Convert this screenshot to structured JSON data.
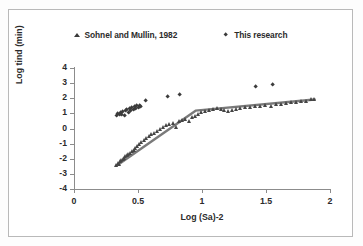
{
  "figure": {
    "background_color": "#ffffff",
    "border_color": "#b9b9b9"
  },
  "legend": {
    "position": "top-center",
    "entries": [
      {
        "label": "Sohnel and Mullin, 1982",
        "marker": "triangle-marker-icon",
        "color": "#3a3a3a"
      },
      {
        "label": "This research",
        "marker": "diamond-marker-icon",
        "color": "#3a3a3a"
      }
    ]
  },
  "chart_data": {
    "type": "scatter",
    "title": "",
    "xlabel": "Log (Sa)-2",
    "ylabel": "Log tind (min)",
    "xlim": [
      0,
      2
    ],
    "ylim": [
      -4,
      4
    ],
    "xticks": [
      0,
      0.5,
      1,
      1.5,
      2
    ],
    "xtick_labels": [
      "0",
      "0.5",
      "1",
      "1.5",
      "2"
    ],
    "yticks": [
      -4,
      -3,
      -2,
      -1,
      0,
      1,
      2,
      3,
      4
    ],
    "ytick_labels": [
      "-4",
      "-3",
      "-2",
      "-1",
      "0",
      "1",
      "2",
      "3",
      "4"
    ],
    "grid": false,
    "legend_position": "top-center",
    "series": [
      {
        "name": "Sohnel and Mullin, 1982",
        "marker": "triangle",
        "color": "#454545",
        "points": [
          [
            0.335,
            -2.45
          ],
          [
            0.345,
            -2.3
          ],
          [
            0.355,
            -2.35
          ],
          [
            0.365,
            -2.2
          ],
          [
            0.375,
            -2.1
          ],
          [
            0.385,
            -2.05
          ],
          [
            0.395,
            -1.95
          ],
          [
            0.405,
            -1.85
          ],
          [
            0.415,
            -1.8
          ],
          [
            0.425,
            -1.72
          ],
          [
            0.44,
            -1.62
          ],
          [
            0.455,
            -1.52
          ],
          [
            0.47,
            -1.42
          ],
          [
            0.485,
            -1.3
          ],
          [
            0.5,
            -1.18
          ],
          [
            0.515,
            -1.05
          ],
          [
            0.53,
            -0.95
          ],
          [
            0.55,
            -0.8
          ],
          [
            0.57,
            -0.68
          ],
          [
            0.59,
            -0.55
          ],
          [
            0.61,
            -0.42
          ],
          [
            0.63,
            -0.3
          ],
          [
            0.65,
            -0.2
          ],
          [
            0.675,
            -0.05
          ],
          [
            0.7,
            0.05
          ],
          [
            0.725,
            0.18
          ],
          [
            0.75,
            0.28
          ],
          [
            0.775,
            0.35
          ],
          [
            0.8,
            0.08
          ],
          [
            0.825,
            0.48
          ],
          [
            0.85,
            0.55
          ],
          [
            0.875,
            0.62
          ],
          [
            0.9,
            0.5
          ],
          [
            0.925,
            0.72
          ],
          [
            0.95,
            0.8
          ],
          [
            0.975,
            0.95
          ],
          [
            1.0,
            1.08
          ],
          [
            1.03,
            1.15
          ],
          [
            1.06,
            1.22
          ],
          [
            1.09,
            1.28
          ],
          [
            1.12,
            1.32
          ],
          [
            1.15,
            1.25
          ],
          [
            1.18,
            1.2
          ],
          [
            1.21,
            1.12
          ],
          [
            1.24,
            1.18
          ],
          [
            1.27,
            1.28
          ],
          [
            1.3,
            1.35
          ],
          [
            1.34,
            1.42
          ],
          [
            1.38,
            1.38
          ],
          [
            1.42,
            1.45
          ],
          [
            1.46,
            1.48
          ],
          [
            1.5,
            1.52
          ],
          [
            1.54,
            1.48
          ],
          [
            1.58,
            1.58
          ],
          [
            1.62,
            1.62
          ],
          [
            1.66,
            1.66
          ],
          [
            1.7,
            1.7
          ],
          [
            1.74,
            1.72
          ],
          [
            1.78,
            1.78
          ],
          [
            1.82,
            1.8
          ],
          [
            1.855,
            1.9
          ],
          [
            1.88,
            1.92
          ]
        ]
      },
      {
        "name": "This research",
        "marker": "diamond",
        "color": "#3c3c3c",
        "points": [
          [
            0.335,
            0.82
          ],
          [
            0.345,
            0.95
          ],
          [
            0.355,
            0.88
          ],
          [
            0.365,
            1.02
          ],
          [
            0.375,
            0.9
          ],
          [
            0.385,
            1.08
          ],
          [
            0.395,
            0.85
          ],
          [
            0.405,
            1.15
          ],
          [
            0.415,
            1.2
          ],
          [
            0.425,
            1.05
          ],
          [
            0.435,
            1.28
          ],
          [
            0.445,
            1.18
          ],
          [
            0.455,
            1.35
          ],
          [
            0.465,
            1.25
          ],
          [
            0.475,
            1.42
          ],
          [
            0.485,
            1.3
          ],
          [
            0.495,
            1.48
          ],
          [
            0.505,
            1.38
          ],
          [
            0.515,
            1.52
          ],
          [
            0.525,
            1.45
          ],
          [
            0.56,
            1.8
          ],
          [
            0.735,
            2.08
          ],
          [
            0.83,
            2.25
          ],
          [
            1.42,
            2.78
          ],
          [
            1.55,
            2.9
          ]
        ]
      }
    ],
    "trendline": {
      "name": "piecewise-fit-line",
      "color": "#7a7a7a",
      "vertices": [
        [
          0.335,
          -2.45
        ],
        [
          0.95,
          1.18
        ],
        [
          1.88,
          1.92
        ]
      ]
    }
  }
}
